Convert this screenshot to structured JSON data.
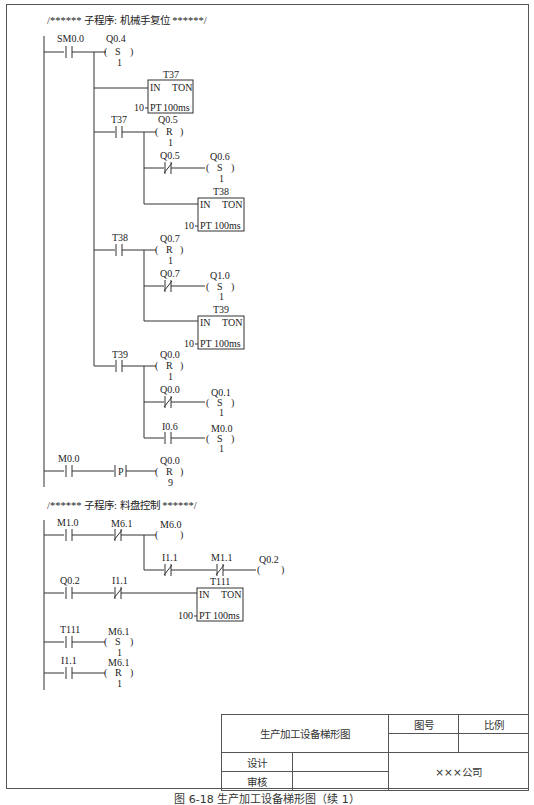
{
  "section1": {
    "comment": "/****** 子程序: 机械手复位 ******/",
    "rung1": {
      "contact": "SM0.0",
      "coil": {
        "addr": "Q0.4",
        "type": "S",
        "n": "1"
      },
      "timer1": {
        "name": "T37",
        "type": "TON",
        "in": "IN",
        "pt": "PT",
        "base": "100ms",
        "preset": "10"
      },
      "t37_contact": "T37",
      "q05_coil": {
        "addr": "Q0.5",
        "type": "R",
        "n": "1"
      },
      "q05_nc": "Q0.5",
      "q06_coil": {
        "addr": "Q0.6",
        "type": "S",
        "n": "1"
      },
      "timer2": {
        "name": "T38",
        "type": "TON",
        "in": "IN",
        "pt": "PT",
        "base": "100ms",
        "preset": "10"
      },
      "t38_contact": "T38",
      "q07_coil": {
        "addr": "Q0.7",
        "type": "R",
        "n": "1"
      },
      "q07_nc": "Q0.7",
      "q10_coil": {
        "addr": "Q1.0",
        "type": "S",
        "n": "1"
      },
      "timer3": {
        "name": "T39",
        "type": "TON",
        "in": "IN",
        "pt": "PT",
        "base": "100ms",
        "preset": "10"
      },
      "t39_contact": "T39",
      "q00_coil": {
        "addr": "Q0.0",
        "type": "R",
        "n": "1"
      },
      "q00_nc": "Q0.0",
      "q01_coil": {
        "addr": "Q0.1",
        "type": "S",
        "n": "1"
      },
      "i06_contact": "I0.6",
      "m00_coil": {
        "addr": "M0.0",
        "type": "S",
        "n": "1"
      }
    },
    "rung2": {
      "contact": "M0.0",
      "edge": "P",
      "coil": {
        "addr": "Q0.0",
        "type": "R",
        "n": "9"
      }
    }
  },
  "section2": {
    "comment": "/****** 子程序: 料盘控制 ******/",
    "rung1": {
      "m10": "M1.0",
      "m61_nc": "M6.1",
      "m60_coil": "M6.0",
      "i11_nc": "I1.1",
      "m11_nc": "M1.1",
      "q02_coil": "Q0.2"
    },
    "rung2": {
      "q02": "Q0.2",
      "i11_nc": "I1.1",
      "timer": {
        "name": "T111",
        "type": "TON",
        "in": "IN",
        "pt": "PT",
        "base": "100ms",
        "preset": "100"
      }
    },
    "rung3": {
      "contact": "T111",
      "coil": {
        "addr": "M6.1",
        "type": "S",
        "n": "1"
      }
    },
    "rung4": {
      "contact": "I1.1",
      "coil": {
        "addr": "M6.1",
        "type": "R",
        "n": "1"
      }
    }
  },
  "title_block": {
    "drawing_name": "生产加工设备梯形图",
    "drawing_no_label": "图号",
    "scale_label": "比例",
    "design_label": "设计",
    "review_label": "审核",
    "company": "×××公司"
  },
  "caption": "图 6-18  生产加工设备梯形图（续 1）"
}
